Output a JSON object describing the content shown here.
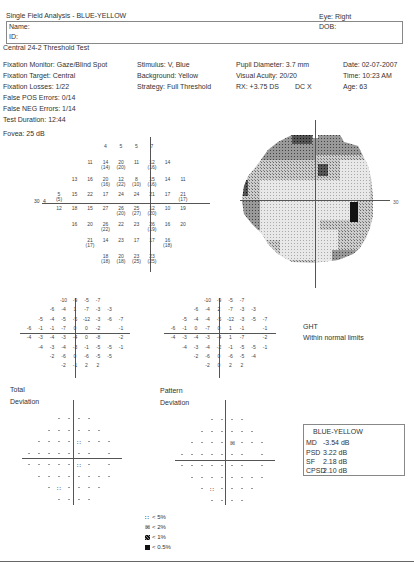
{
  "header": {
    "title": "Single Field Analysis - BLUE-YELLOW",
    "eye": "Eye: Right",
    "name_label": "Name:",
    "id_label": "ID:",
    "dob_label": "DOB:",
    "test_name": "Central 24-2 Threshold Test"
  },
  "reliability": {
    "fixation_monitor": "Fixation Monitor: Gaze/Blind Spot",
    "fixation_target": "Fixation Target: Central",
    "fixation_losses": "Fixation Losses: 1/22",
    "false_pos": "False POS Errors: 0/14",
    "false_neg": "False NEG Errors: 1/14",
    "duration": "Test Duration: 12:44",
    "fovea": "Fovea: 25 dB"
  },
  "stimulus": {
    "stimulus": "Stimulus: V, Blue",
    "background": "Background: Yellow",
    "strategy": "Strategy: Full Threshold"
  },
  "patient": {
    "pupil": "Pupil Diameter: 3.7 mm",
    "acuity": "Visual Acuity: 20/20",
    "rx": "RX: +3.75 DS",
    "dc": "DC  X",
    "date": "Date: 02-07-2007",
    "time": "Time: 10:23 AM",
    "age": "Age: 63"
  },
  "threshold_plot": {
    "axis_label_left": "30",
    "axis_label_right": "30",
    "rows": [
      [
        {
          "v": "4"
        },
        {
          "v": "5"
        },
        {
          "v": "5"
        },
        {
          "v": "7"
        }
      ],
      [
        {
          "v": "11"
        },
        {
          "v": "14",
          "r": "(14)"
        },
        {
          "v": "20",
          "r": "(20)"
        },
        {
          "v": "11"
        },
        {
          "v": "12",
          "r": "(16)"
        },
        {
          "v": "14"
        }
      ],
      [
        {
          "v": "13"
        },
        {
          "v": "16"
        },
        {
          "v": "20",
          "r": "(16)"
        },
        {
          "v": "12",
          "r": "(22)"
        },
        {
          "v": "8",
          "r": "(10)"
        },
        {
          "v": "15",
          "r": "(16)"
        },
        {
          "v": "14"
        },
        {
          "v": "11"
        }
      ],
      [
        {
          "v": "5",
          "r": "(5)"
        },
        {
          "v": "15"
        },
        {
          "v": "22"
        },
        {
          "v": "17"
        },
        {
          "v": "24"
        },
        {
          "v": "24"
        },
        {
          "v": "21"
        },
        {
          "v": "17"
        },
        {
          "v": "21",
          "r": "(17)"
        }
      ],
      [
        {
          "v": "12"
        },
        {
          "v": "18"
        },
        {
          "v": "15"
        },
        {
          "v": "27"
        },
        {
          "v": "26",
          "r": "(20)"
        },
        {
          "v": "25",
          "r": "(27)"
        },
        {
          "v": "12",
          "r": "(20)"
        },
        {
          "v": "10"
        },
        {
          "v": "19"
        }
      ],
      [
        {
          "v": "16"
        },
        {
          "v": "20"
        },
        {
          "v": "26",
          "r": "(22)"
        },
        {
          "v": "22"
        },
        {
          "v": "23"
        },
        {
          "v": "26",
          "r": "(19)"
        },
        {
          "v": "16"
        },
        {
          "v": "20"
        }
      ],
      [
        {
          "v": "21",
          "r": "(17)"
        },
        {
          "v": "14"
        },
        {
          "v": "23"
        },
        {
          "v": "17"
        },
        {
          "v": "17"
        },
        {
          "v": "16",
          "r": "(18)"
        }
      ],
      [
        {
          "v": "18",
          "r": "(18)"
        },
        {
          "v": "20",
          "r": "(18)"
        },
        {
          "v": "23",
          "r": "(25)"
        },
        {
          "v": "23",
          "r": "(25)"
        }
      ]
    ],
    "blind_spot_value": "4"
  },
  "total_deviation_values": [
    [
      "-10",
      "-9",
      "-5",
      "-7"
    ],
    [
      "-6",
      "-4",
      "1",
      "-7",
      "-3",
      "-3"
    ],
    [
      "-5",
      "-4",
      "-5",
      "-5",
      "-12",
      "-3",
      "-6",
      "-7"
    ],
    [
      "-6",
      "-1",
      "-1",
      "-7",
      "0",
      "0",
      "-2",
      "",
      "-1"
    ],
    [
      "-4",
      "-3",
      "-4",
      "-3",
      "-4",
      "0",
      "-8",
      "",
      "-2"
    ],
    [
      "-4",
      "-3",
      "-4",
      "-3",
      "-1",
      "-5",
      "-5",
      "-1"
    ],
    [
      "-2",
      "-6",
      "0",
      "-6",
      "-5",
      "-5"
    ],
    [
      "-2",
      "-1",
      "2",
      "2"
    ]
  ],
  "pattern_deviation_values": [
    [
      "-10",
      "-9",
      "-5",
      "-7"
    ],
    [
      "-6",
      "-4",
      "2",
      "-7",
      "-3",
      "-3"
    ],
    [
      "-5",
      "-4",
      "-4",
      "-5",
      "-12",
      "-3",
      "-5",
      "-7"
    ],
    [
      "-6",
      "-1",
      "0",
      "-7",
      "0",
      "1",
      "-1",
      "",
      "-1"
    ],
    [
      "-4",
      "-3",
      "-4",
      "-3",
      "-4",
      "1",
      "-7",
      "",
      "-2"
    ],
    [
      "-4",
      "-3",
      "-4",
      "-2",
      "-1",
      "-5",
      "-5",
      "-1"
    ],
    [
      "-2",
      "-6",
      "0",
      "-6",
      "-5",
      "-4"
    ],
    [
      "-2",
      "0",
      "2",
      "2"
    ]
  ],
  "total_deviation": {
    "label1": "Total",
    "label2": "Deviation"
  },
  "pattern_deviation": {
    "label1": "Pattern",
    "label2": "Deviation"
  },
  "ght": {
    "label": "GHT",
    "result": "Within normal limits"
  },
  "global_indices": {
    "title": "BLUE-YELLOW",
    "md_label": "MD",
    "md": "-3.54 dB",
    "psd_label": "PSD",
    "psd": "3.22 dB",
    "sf_label": "SF",
    "sf": "2.18 dB",
    "cpsd_label": "CPSD",
    "cpsd": "2.10 dB"
  },
  "legend": {
    "p5": "< 5%",
    "p2": "< 2%",
    "p1": "< 1%",
    "p05": "< 0.5%"
  }
}
